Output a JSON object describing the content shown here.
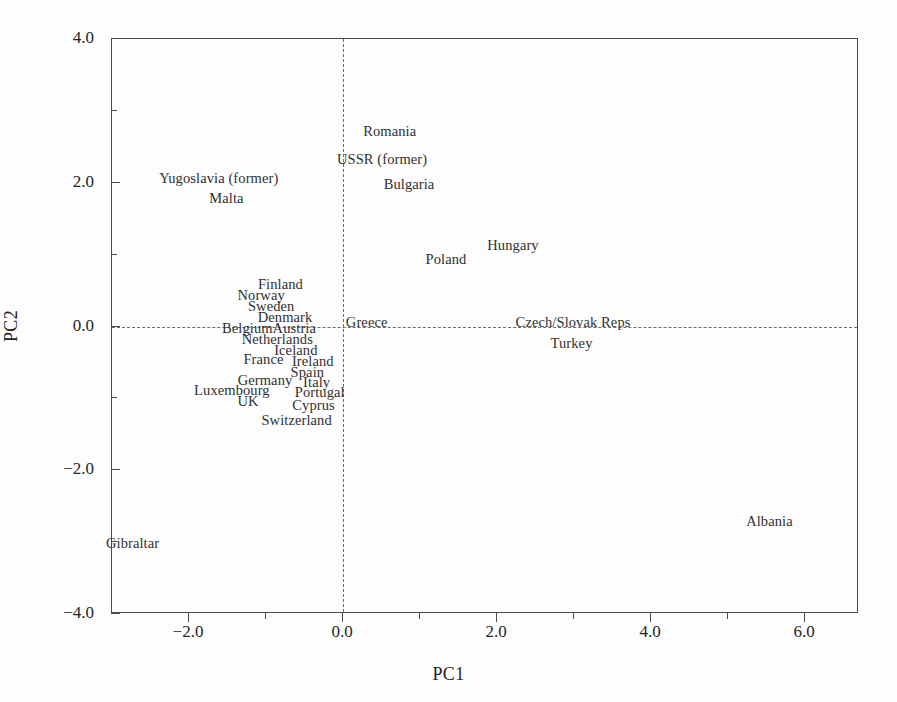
{
  "chart_data": {
    "type": "scatter",
    "title": "",
    "xlabel": "PC1",
    "ylabel": "PC2",
    "xlim": [
      -3.0,
      6.7
    ],
    "ylim": [
      -4.0,
      4.0
    ],
    "grid": false,
    "legend": "none",
    "marker_style": "text-label-only",
    "xticks": [
      -2.0,
      0.0,
      2.0,
      4.0,
      6.0
    ],
    "xticklabels": [
      "-2.0",
      "0.0",
      "2.0",
      "4.0",
      "6.0"
    ],
    "xminorticks": [
      -1.0,
      1.0,
      3.0,
      5.0
    ],
    "yticks": [
      4.0,
      2.0,
      0.0,
      -2.0,
      -4.0
    ],
    "yticklabels": [
      "4.0",
      "2.0",
      "0.0",
      "-2.0",
      "-4.0"
    ],
    "yminorticks": [
      3.0,
      1.0,
      -1.0,
      -3.0
    ],
    "reference_lines": [
      {
        "axis": "x",
        "value": 0.0,
        "style": "dashed"
      },
      {
        "axis": "y",
        "value": 0.0,
        "style": "dashed"
      }
    ],
    "points": [
      {
        "label": "Romania",
        "x": 0.62,
        "y": 2.7
      },
      {
        "label": "USSR (former)",
        "x": 0.52,
        "y": 2.32
      },
      {
        "label": "Yugoslavia (former)",
        "x": -1.6,
        "y": 2.05
      },
      {
        "label": "Bulgaria",
        "x": 0.87,
        "y": 1.97
      },
      {
        "label": "Malta",
        "x": -1.5,
        "y": 1.78
      },
      {
        "label": "Hungary",
        "x": 2.22,
        "y": 1.12
      },
      {
        "label": "Poland",
        "x": 1.35,
        "y": 0.92
      },
      {
        "label": "Finland",
        "x": -0.8,
        "y": 0.58
      },
      {
        "label": "Norway",
        "x": -1.05,
        "y": 0.42
      },
      {
        "label": "Sweden",
        "x": -0.92,
        "y": 0.27
      },
      {
        "label": "Denmark",
        "x": -0.74,
        "y": 0.12
      },
      {
        "label": "Greece",
        "x": 0.32,
        "y": 0.05
      },
      {
        "label": "Czech/Slovak Reps",
        "x": 3.0,
        "y": 0.05
      },
      {
        "label": "Belgium",
        "x": -1.23,
        "y": -0.03
      },
      {
        "label": "Austria",
        "x": -0.62,
        "y": -0.03
      },
      {
        "label": "Netherlands",
        "x": -0.84,
        "y": -0.19
      },
      {
        "label": "Turkey",
        "x": 2.98,
        "y": -0.25
      },
      {
        "label": "Iceland",
        "x": -0.6,
        "y": -0.34
      },
      {
        "label": "France",
        "x": -1.02,
        "y": -0.47
      },
      {
        "label": "Ireland",
        "x": -0.38,
        "y": -0.5
      },
      {
        "label": "Spain",
        "x": -0.45,
        "y": -0.64
      },
      {
        "label": "Germany",
        "x": -1.0,
        "y": -0.76
      },
      {
        "label": "Italy",
        "x": -0.33,
        "y": -0.78
      },
      {
        "label": "Luxembourg",
        "x": -1.43,
        "y": -0.9
      },
      {
        "label": "Portugal",
        "x": -0.29,
        "y": -0.93
      },
      {
        "label": "UK",
        "x": -1.22,
        "y": -1.05
      },
      {
        "label": "Cyprus",
        "x": -0.37,
        "y": -1.1
      },
      {
        "label": "Switzerland",
        "x": -0.59,
        "y": -1.32
      },
      {
        "label": "Albania",
        "x": 5.55,
        "y": -2.72
      },
      {
        "label": "Gibraltar",
        "x": -2.72,
        "y": -3.02
      }
    ]
  }
}
